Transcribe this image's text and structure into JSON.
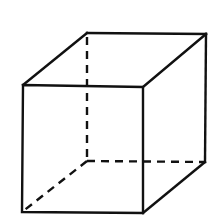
{
  "diagram": {
    "type": "wireframe-cube",
    "stroke_color": "#111111",
    "background": "#ffffff",
    "vertices": {
      "front_top_left": [
        23,
        85
      ],
      "front_top_right": [
        143,
        87
      ],
      "front_bottom_left": [
        22,
        212
      ],
      "front_bottom_right": [
        143,
        213
      ],
      "back_top_left": [
        87,
        33
      ],
      "back_top_right": [
        206,
        34
      ],
      "back_bottom_left": [
        87,
        161
      ],
      "back_bottom_right": [
        205,
        162
      ]
    },
    "hidden_edges_style": "dashed"
  }
}
